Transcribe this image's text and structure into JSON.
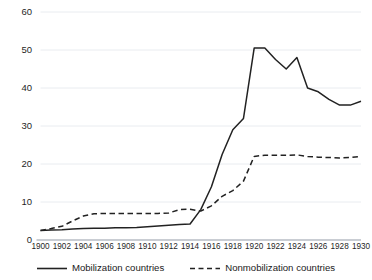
{
  "chart_data": {
    "type": "line",
    "title": "",
    "subtitle": "",
    "xlabel": "",
    "ylabel": "",
    "xlim": [
      1900,
      1930
    ],
    "ylim": [
      0,
      60
    ],
    "yticks": [
      0,
      10,
      20,
      30,
      40,
      50,
      60
    ],
    "xticks": [
      1900,
      1902,
      1904,
      1906,
      1908,
      1910,
      1912,
      1914,
      1916,
      1918,
      1920,
      1922,
      1924,
      1926,
      1928,
      1930
    ],
    "grid": "horizontal",
    "legend_position": "bottom",
    "x": [
      1900,
      1901,
      1902,
      1903,
      1904,
      1905,
      1906,
      1907,
      1908,
      1909,
      1910,
      1911,
      1912,
      1913,
      1914,
      1915,
      1916,
      1917,
      1918,
      1919,
      1920,
      1921,
      1922,
      1923,
      1924,
      1925,
      1926,
      1927,
      1928,
      1929,
      1930
    ],
    "series": [
      {
        "name": "Mobilization countries",
        "style": "solid",
        "color": "#222222",
        "values": [
          2.5,
          2.6,
          2.7,
          2.9,
          3.0,
          3.1,
          3.1,
          3.2,
          3.2,
          3.3,
          3.5,
          3.7,
          3.9,
          4.1,
          4.2,
          8.0,
          14.0,
          22.5,
          29.0,
          32.0,
          50.5,
          50.5,
          47.5,
          45.0,
          48.0,
          40.0,
          39.0,
          37.0,
          35.5,
          35.5,
          36.5
        ]
      },
      {
        "name": "Nonmobilization countries",
        "style": "dashed",
        "color": "#222222",
        "values": [
          2.5,
          3.0,
          3.6,
          5.0,
          6.3,
          6.9,
          7.0,
          7.0,
          7.0,
          7.0,
          7.0,
          7.0,
          7.1,
          8.0,
          8.1,
          7.6,
          9.0,
          11.5,
          13.0,
          15.5,
          22.0,
          22.3,
          22.3,
          22.3,
          22.4,
          22.0,
          21.8,
          21.7,
          21.6,
          21.7,
          22.0
        ]
      }
    ]
  },
  "legend": {
    "items": [
      {
        "label": "Mobilization countries",
        "icon": "solid-line-swatch"
      },
      {
        "label": "Nonmobilization countries",
        "icon": "dashed-line-swatch"
      }
    ]
  },
  "axis": {
    "y_labels": [
      "60",
      "50",
      "40",
      "30",
      "20",
      "10",
      "0"
    ],
    "x_labels": [
      "1900",
      "1902",
      "1904",
      "1906",
      "1908",
      "1910",
      "1912",
      "1914",
      "1916",
      "1918",
      "1920",
      "1922",
      "1924",
      "1926",
      "1928",
      "1930"
    ]
  },
  "colors": {
    "line": "#222222",
    "gridline": "#e9ecf0",
    "axis": "#b7bdc4",
    "text": "#1a1a1a",
    "background": "#ffffff"
  }
}
